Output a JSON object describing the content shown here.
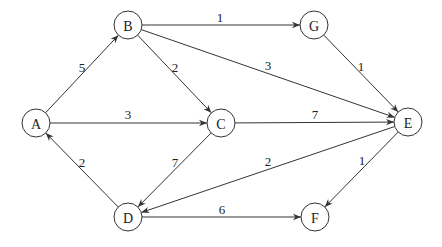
{
  "diagram": {
    "type": "directed-weighted-graph",
    "nodes": [
      {
        "id": "A",
        "label": "A",
        "x": 36,
        "y": 123
      },
      {
        "id": "B",
        "label": "B",
        "x": 128,
        "y": 25
      },
      {
        "id": "C",
        "label": "C",
        "x": 221,
        "y": 123
      },
      {
        "id": "G",
        "label": "G",
        "x": 314,
        "y": 25
      },
      {
        "id": "E",
        "label": "E",
        "x": 408,
        "y": 122
      },
      {
        "id": "D",
        "label": "D",
        "x": 128,
        "y": 217
      },
      {
        "id": "F",
        "label": "F",
        "x": 315,
        "y": 217
      }
    ],
    "edges": [
      {
        "from": "A",
        "to": "B",
        "weight": "5",
        "lx": 82,
        "ly": 67
      },
      {
        "from": "B",
        "to": "G",
        "weight": "1",
        "lx": 220,
        "ly": 17
      },
      {
        "from": "B",
        "to": "C",
        "weight": "2",
        "lx": 175,
        "ly": 67
      },
      {
        "from": "B",
        "to": "E",
        "weight": "3",
        "lx": 268,
        "ly": 65
      },
      {
        "from": "G",
        "to": "E",
        "weight": "1",
        "lx": 361,
        "ly": 66
      },
      {
        "from": "A",
        "to": "C",
        "weight": "3",
        "lx": 128,
        "ly": 114
      },
      {
        "from": "C",
        "to": "E",
        "weight": "7",
        "lx": 315,
        "ly": 114
      },
      {
        "from": "C",
        "to": "D",
        "weight": "7",
        "lx": 175,
        "ly": 162
      },
      {
        "from": "D",
        "to": "A",
        "weight": "2",
        "lx": 82,
        "ly": 162
      },
      {
        "from": "E",
        "to": "D",
        "weight": "2",
        "lx": 268,
        "ly": 161
      },
      {
        "from": "E",
        "to": "F",
        "weight": "1",
        "lx": 362,
        "ly": 160
      },
      {
        "from": "D",
        "to": "F",
        "weight": "6",
        "lx": 222,
        "ly": 209
      }
    ],
    "node_radius": 14,
    "colors": {
      "stroke": "#333333",
      "text": "#222222",
      "background": "#ffffff"
    }
  }
}
